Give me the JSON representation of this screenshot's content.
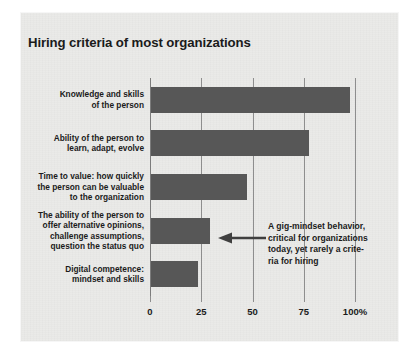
{
  "chart_data": {
    "type": "bar",
    "orientation": "horizontal",
    "title": "Hiring criteria of most organizations",
    "xlabel": "",
    "ylabel": "",
    "xlim": [
      0,
      100
    ],
    "grid": true,
    "legend": null,
    "x_tick_labels": [
      "0",
      "25",
      "50",
      "75",
      "100%"
    ],
    "x_tick_values": [
      0,
      25,
      50,
      75,
      100
    ],
    "categories": [
      "Knowledge and skills of the person",
      "Ability of the person to learn, adapt, evolve",
      "Time to value: how quickly the person can be valuable to the organization",
      "The ability of the person to offer alternative opinions, challenge assumptions, question the status quo",
      "Digital competence: mindset and skills"
    ],
    "category_lines": [
      [
        "Knowledge and skills",
        "of the person"
      ],
      [
        "Ability of the person to",
        "learn, adapt, evolve"
      ],
      [
        "Time to value: how quickly",
        "the person can be valuable",
        "to the organization"
      ],
      [
        "The ability of the person to",
        "offer alternative opinions,",
        "challenge assumptions,",
        "question the status quo"
      ],
      [
        "Digital competence:",
        "mindset and skills"
      ]
    ],
    "values": [
      97,
      77,
      47,
      29,
      23
    ],
    "annotations": [
      {
        "name": "gig-mindset-callout",
        "target_category_index": 3,
        "arrow": "left-arrow",
        "lines": [
          "A gig-mindset behavior,",
          "critical for organizations",
          "today, yet rarely a crite-",
          "ria for hiring"
        ]
      }
    ],
    "colors": {
      "bar": "#575757",
      "panel_background": "#eaeae8",
      "page_background": "#ffffff",
      "gridline": "#8e8e8e",
      "text": "#1b1b1b"
    }
  }
}
